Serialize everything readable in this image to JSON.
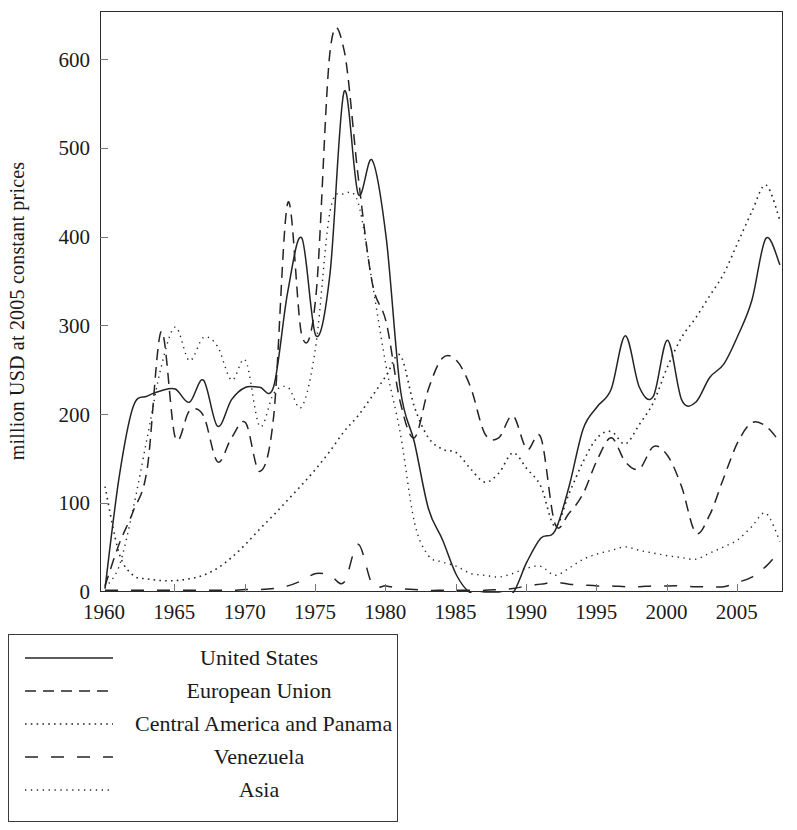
{
  "chart_data": {
    "type": "line",
    "title": "",
    "xlabel": "",
    "ylabel": "million USD at 2005 constant prices",
    "xlim": [
      1960,
      2008
    ],
    "ylim": [
      0,
      655
    ],
    "grid": false,
    "legend_position": "below-left",
    "xticks": [
      1960,
      1965,
      1970,
      1975,
      1980,
      1985,
      1990,
      1995,
      2000,
      2005
    ],
    "yticks": [
      0,
      100,
      200,
      300,
      400,
      500,
      600
    ],
    "x": [
      1960,
      1961,
      1962,
      1963,
      1964,
      1965,
      1966,
      1967,
      1968,
      1969,
      1970,
      1971,
      1972,
      1973,
      1974,
      1975,
      1976,
      1977,
      1978,
      1979,
      1980,
      1981,
      1982,
      1983,
      1984,
      1985,
      1986,
      1987,
      1988,
      1989,
      1990,
      1991,
      1992,
      1993,
      1994,
      1995,
      1996,
      1997,
      1998,
      1999,
      2000,
      2001,
      2002,
      2003,
      2004,
      2005,
      2006,
      2007,
      2008
    ],
    "series": [
      {
        "name": "United States",
        "style": "solid",
        "values": [
          5,
          130,
          210,
          222,
          228,
          230,
          215,
          240,
          188,
          218,
          232,
          232,
          233,
          340,
          400,
          290,
          360,
          565,
          450,
          488,
          400,
          230,
          170,
          95,
          60,
          20,
          0,
          0,
          0,
          0,
          35,
          62,
          70,
          120,
          185,
          210,
          230,
          290,
          232,
          222,
          285,
          218,
          215,
          243,
          258,
          290,
          330,
          400,
          370
        ]
      },
      {
        "name": "European Union",
        "style": "dashed",
        "values": [
          8,
          55,
          92,
          140,
          295,
          175,
          205,
          200,
          148,
          175,
          192,
          137,
          200,
          440,
          290,
          335,
          610,
          612,
          470,
          350,
          305,
          215,
          175,
          230,
          265,
          262,
          232,
          180,
          175,
          200,
          162,
          175,
          78,
          90,
          112,
          150,
          175,
          148,
          140,
          165,
          155,
          120,
          68,
          88,
          130,
          170,
          192,
          188,
          170
        ]
      },
      {
        "name": "Central America and Panama",
        "style": "dotted",
        "values": [
          120,
          45,
          20,
          16,
          14,
          14,
          16,
          20,
          28,
          40,
          55,
          72,
          88,
          105,
          122,
          140,
          160,
          182,
          200,
          222,
          245,
          268,
          210,
          175,
          162,
          158,
          140,
          125,
          135,
          158,
          140,
          120,
          75,
          112,
          148,
          175,
          182,
          168,
          190,
          215,
          255,
          288,
          310,
          335,
          360,
          395,
          430,
          460,
          420
        ]
      },
      {
        "name": "Venezuela",
        "style": "longdash",
        "values": [
          3,
          3,
          3,
          3,
          3,
          3,
          3,
          3,
          3,
          3,
          4,
          4,
          5,
          8,
          14,
          22,
          20,
          12,
          55,
          10,
          8,
          5,
          4,
          3,
          3,
          3,
          3,
          3,
          4,
          5,
          8,
          10,
          12,
          10,
          9,
          8,
          8,
          7,
          7,
          8,
          8,
          8,
          7,
          7,
          7,
          12,
          18,
          30,
          48
        ]
      },
      {
        "name": "Asia",
        "style": "finedotted",
        "values": [
          6,
          30,
          95,
          175,
          255,
          300,
          262,
          288,
          278,
          240,
          262,
          188,
          225,
          232,
          210,
          280,
          430,
          450,
          440,
          350,
          255,
          180,
          80,
          42,
          35,
          30,
          22,
          20,
          18,
          22,
          28,
          30,
          20,
          28,
          38,
          44,
          48,
          52,
          48,
          45,
          42,
          40,
          38,
          45,
          52,
          60,
          75,
          90,
          58
        ]
      }
    ]
  },
  "legend": {
    "items": [
      {
        "label": "United States",
        "style": "solid"
      },
      {
        "label": "European Union",
        "style": "dashed"
      },
      {
        "label": "Central America and Panama",
        "style": "dotted"
      },
      {
        "label": "Venezuela",
        "style": "longdash"
      },
      {
        "label": "Asia",
        "style": "finedotted"
      }
    ]
  },
  "axis": {
    "y_tick_labels": [
      "0",
      "100",
      "200",
      "300",
      "400",
      "500",
      "600"
    ],
    "x_tick_labels": [
      "1960",
      "1965",
      "1970",
      "1975",
      "1980",
      "1985",
      "1990",
      "1995",
      "2000",
      "2005"
    ]
  }
}
